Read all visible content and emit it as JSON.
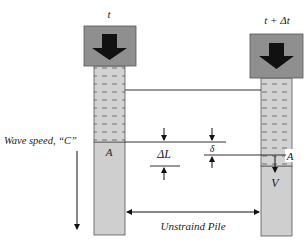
{
  "diagram": {
    "left_pile": {
      "time_label": "t",
      "section_label": "A"
    },
    "right_pile": {
      "time_label": "t + Δt",
      "section_label": "A",
      "velocity_label": "V"
    },
    "labels": {
      "wave_speed": "Wave speed, “C”",
      "delta_L": "ΔL",
      "delta": "δ",
      "unstrained": "Unstraind Pile"
    },
    "colors": {
      "cap": "#8f8f8f",
      "pile": "#cfcfcf",
      "strained_dash": "#777777",
      "line": "#333333",
      "arrow": "#111111"
    }
  }
}
